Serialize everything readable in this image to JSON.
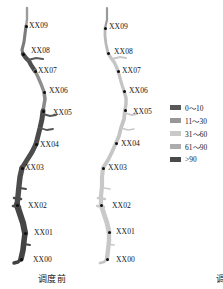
{
  "chart_data": {
    "type": "map",
    "title": "",
    "panels": [
      {
        "id": "before",
        "caption": "调度前",
        "dominant_class": ">90",
        "dominant_color": "#4f4f4f",
        "stations": [
          {
            "label": "XX09",
            "value_class": "0~10",
            "color": "#9c9c9c"
          },
          {
            "label": "XX08",
            "value_class": ">90",
            "color": "#4f4f4f"
          },
          {
            "label": "XX07",
            "value_class": "61~90",
            "color": "#8e8e8e"
          },
          {
            "label": "XX06",
            "value_class": "61~90",
            "color": "#8a8a8a"
          },
          {
            "label": "XX05",
            "value_class": ">90",
            "color": "#4a4a4a"
          },
          {
            "label": "XX04",
            "value_class": ">90",
            "color": "#4d4d4d"
          },
          {
            "label": "XX03",
            "value_class": ">90",
            "color": "#4c4c4c"
          },
          {
            "label": "XX02",
            "value_class": ">90",
            "color": "#464646"
          },
          {
            "label": "XX01",
            "value_class": ">90",
            "color": "#434343"
          },
          {
            "label": "XX00",
            "value_class": ">90",
            "color": "#414141"
          }
        ]
      },
      {
        "id": "after",
        "caption": "调度后",
        "dominant_class": "31~60",
        "dominant_color": "#c3c3c3",
        "stations": [
          {
            "label": "XX09",
            "value_class": "0~10",
            "color": "#b0b0b0"
          },
          {
            "label": "XX08",
            "value_class": "31~60",
            "color": "#c6c6c6"
          },
          {
            "label": "XX07",
            "value_class": "31~60",
            "color": "#c4c4c4"
          },
          {
            "label": "XX06",
            "value_class": "31~60",
            "color": "#c2c2c2"
          },
          {
            "label": "XX05",
            "value_class": "31~60",
            "color": "#c4c4c4"
          },
          {
            "label": "XX04",
            "value_class": "31~60",
            "color": "#c6c6c6"
          },
          {
            "label": "XX03",
            "value_class": "31~60",
            "color": "#c8c8c8"
          },
          {
            "label": "XX02",
            "value_class": "31~60",
            "color": "#c9c9c9"
          },
          {
            "label": "XX01",
            "value_class": "31~60",
            "color": "#c7c7c7"
          },
          {
            "label": "XX00",
            "value_class": "31~60",
            "color": "#c5c5c5"
          }
        ]
      }
    ],
    "legend": {
      "position": "right",
      "entries": [
        {
          "label": "0～10",
          "color": "#585858"
        },
        {
          "label": "11～30",
          "color": "#989898"
        },
        {
          "label": "31～60",
          "color": "#c9c9c9"
        },
        {
          "label": "61～90",
          "color": "#adadad"
        },
        {
          "label": ">90",
          "color": "#4a4a4a"
        }
      ]
    }
  },
  "panels": {
    "before": {
      "caption": "调度前",
      "stations": [
        {
          "label": "XX09",
          "dot_x": 26,
          "dot_y": 26,
          "label_x": 29,
          "label_y": 21
        },
        {
          "label": "XX08",
          "dot_x": 23,
          "dot_y": 54,
          "label_x": 31,
          "label_y": 46
        },
        {
          "label": "XX07",
          "dot_x": 35,
          "dot_y": 71,
          "label_x": 38,
          "label_y": 66
        },
        {
          "label": "XX06",
          "dot_x": 44,
          "dot_y": 92,
          "label_x": 49,
          "label_y": 86
        },
        {
          "label": "XX05",
          "dot_x": 43,
          "dot_y": 111,
          "label_x": 53,
          "label_y": 108
        },
        {
          "label": "XX04",
          "dot_x": 36,
          "dot_y": 144,
          "label_x": 40,
          "label_y": 140
        },
        {
          "label": "XX03",
          "dot_x": 22,
          "dot_y": 168,
          "label_x": 25,
          "label_y": 163
        },
        {
          "label": "XX02",
          "dot_x": 17,
          "dot_y": 205,
          "label_x": 28,
          "label_y": 201
        },
        {
          "label": "XX01",
          "dot_x": 25,
          "dot_y": 233,
          "label_x": 34,
          "label_y": 228
        },
        {
          "label": "XX00",
          "dot_x": 21,
          "dot_y": 259,
          "label_x": 33,
          "label_y": 255
        }
      ]
    },
    "after": {
      "caption": "调度后",
      "stations": [
        {
          "label": "XX09",
          "dot_x": 15,
          "dot_y": 28,
          "label_x": 19,
          "label_y": 22
        },
        {
          "label": "XX08",
          "dot_x": 18,
          "dot_y": 53,
          "label_x": 24,
          "label_y": 47
        },
        {
          "label": "XX07",
          "dot_x": 28,
          "dot_y": 71,
          "label_x": 32,
          "label_y": 66
        },
        {
          "label": "XX06",
          "dot_x": 34,
          "dot_y": 91,
          "label_x": 39,
          "label_y": 86
        },
        {
          "label": "XX05",
          "dot_x": 35,
          "dot_y": 110,
          "label_x": 43,
          "label_y": 107
        },
        {
          "label": "XX04",
          "dot_x": 26,
          "dot_y": 143,
          "label_x": 31,
          "label_y": 139
        },
        {
          "label": "XX03",
          "dot_x": 13,
          "dot_y": 168,
          "label_x": 18,
          "label_y": 163
        },
        {
          "label": "XX02",
          "dot_x": 11,
          "dot_y": 205,
          "label_x": 22,
          "label_y": 201
        },
        {
          "label": "XX01",
          "dot_x": 19,
          "dot_y": 232,
          "label_x": 26,
          "label_y": 227
        },
        {
          "label": "XX00",
          "dot_x": 17,
          "dot_y": 259,
          "label_x": 26,
          "label_y": 255
        }
      ]
    }
  },
  "legend": {
    "entries": [
      {
        "label": "0～10",
        "color": "#585858"
      },
      {
        "label": "11～30",
        "color": "#989898"
      },
      {
        "label": "31～60",
        "color": "#c9c9c9"
      },
      {
        "label": "61～90",
        "color": "#adadad"
      },
      {
        "label": ">90",
        "color": "#4a4a4a"
      }
    ]
  }
}
